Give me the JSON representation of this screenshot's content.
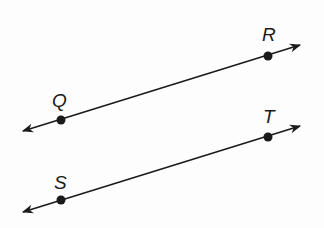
{
  "diagram": {
    "type": "parallel-lines",
    "lines": [
      {
        "name": "QR",
        "start": [
          23,
          131
        ],
        "end": [
          300,
          45
        ],
        "points": [
          {
            "label": "Q",
            "x": 61,
            "y": 120,
            "label_x": 52,
            "label_y": 107
          },
          {
            "label": "R",
            "x": 268,
            "y": 56,
            "label_x": 262,
            "label_y": 41
          }
        ]
      },
      {
        "name": "ST",
        "start": [
          23,
          212
        ],
        "end": [
          300,
          126
        ],
        "points": [
          {
            "label": "S",
            "x": 61,
            "y": 200,
            "label_x": 54,
            "label_y": 189
          },
          {
            "label": "T",
            "x": 268,
            "y": 137,
            "label_x": 263,
            "label_y": 123
          }
        ]
      }
    ],
    "color": "#1a1a1a"
  }
}
